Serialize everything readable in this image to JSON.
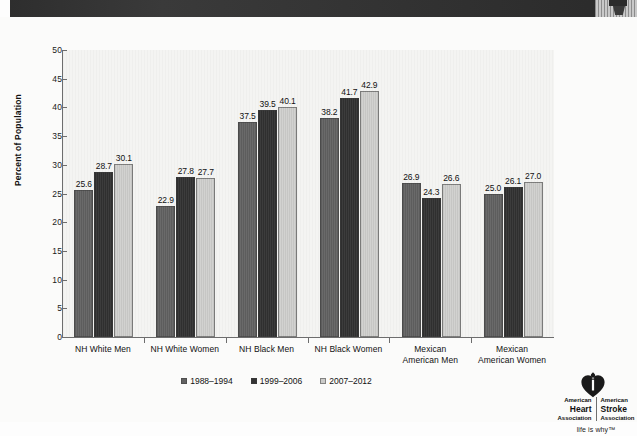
{
  "page": {
    "background_color": "#fbfbfa",
    "scan_bar_color": "#2e2e2e"
  },
  "chart_data": {
    "type": "bar",
    "title": "",
    "xlabel": "",
    "ylabel": "Percent of Population",
    "ylim": [
      0,
      50
    ],
    "ytick_step": 5,
    "ytick_labels": [
      "0",
      "5",
      "10",
      "15",
      "20",
      "25",
      "30",
      "35",
      "40",
      "45",
      "50"
    ],
    "grid": false,
    "legend_position": "bottom",
    "categories": [
      "NH White Men",
      "NH White Women",
      "NH Black Men",
      "NH Black Women",
      "Mexican\nAmerican Men",
      "Mexican\nAmerican Women"
    ],
    "series": [
      {
        "name": "1988–1994",
        "color": "#626262",
        "values": [
          25.6,
          22.9,
          37.5,
          38.2,
          26.9,
          25.0
        ],
        "labels": [
          "25.6",
          "22.9",
          "37.5",
          "38.2",
          "26.9",
          "25.0"
        ]
      },
      {
        "name": "1999–2006",
        "color": "#343434",
        "values": [
          28.7,
          27.8,
          39.5,
          41.7,
          24.3,
          26.1
        ],
        "labels": [
          "28.7",
          "27.8",
          "39.5",
          "41.7",
          "24.3",
          "26.1"
        ]
      },
      {
        "name": "2007–2012",
        "color": "#cbcbc9",
        "values": [
          30.1,
          27.7,
          40.1,
          42.9,
          26.6,
          27.0
        ],
        "labels": [
          "30.1",
          "27.7",
          "40.1",
          "42.9",
          "26.6",
          "27.0"
        ]
      }
    ]
  },
  "logo": {
    "heart_icon": "heart-torch-icon",
    "left_line1": "American",
    "left_line2": "Heart",
    "left_line3": "Association",
    "right_line1": "American",
    "right_line2": "Stroke",
    "right_line3": "Association",
    "tagline": "life is why™"
  }
}
